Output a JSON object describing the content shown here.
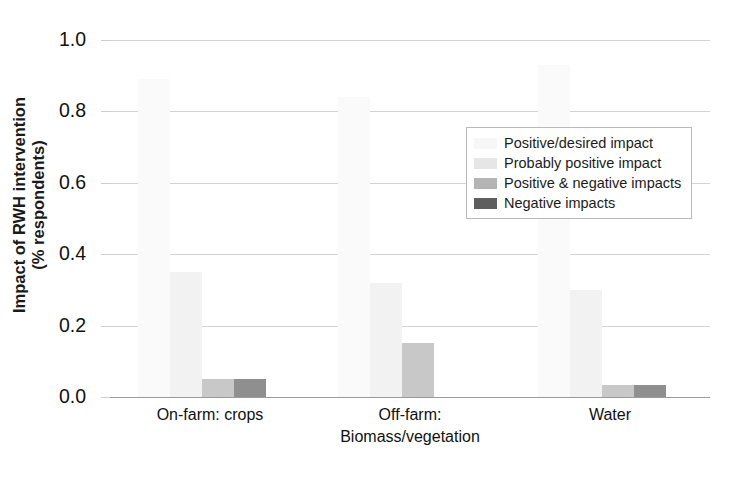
{
  "chart_data": {
    "type": "bar",
    "title": "",
    "subtitle": "",
    "xlabel": "",
    "ylabel": "Impact of RWH intervention (% respondents)",
    "ylabel_lines": [
      "Impact of RWH intervention",
      "(% respondents)"
    ],
    "ylim": [
      0.0,
      1.0
    ],
    "yticks": [
      "1.0",
      "0.8",
      "0.6",
      "0.4",
      "0.2",
      "0.0"
    ],
    "ytick_values": [
      1.0,
      0.8,
      0.6,
      0.4,
      0.2,
      0.0
    ],
    "grid": true,
    "grid_axis": "y",
    "legend_position": "upper-right",
    "categories": [
      "On-farm: crops",
      "Off-farm: Biomass/vegetation",
      "Water"
    ],
    "category_lines": [
      [
        "On-farm: crops"
      ],
      [
        "Off-farm:",
        "Biomass/vegetation"
      ],
      [
        "Water"
      ]
    ],
    "series": [
      {
        "name": "Positive/desired impact",
        "color": "#fafafa",
        "values": [
          0.89,
          0.84,
          0.93
        ]
      },
      {
        "name": "Probably positive impact",
        "color": "#f2f2f2",
        "values": [
          0.35,
          0.32,
          0.3
        ]
      },
      {
        "name": "Positive & negative impacts",
        "color": "#c8c8c8",
        "values": [
          0.05,
          0.15,
          0.035
        ]
      },
      {
        "name": "Negative impacts",
        "color": "#8f8f8f",
        "values": [
          0.05,
          0.0,
          0.035
        ]
      }
    ]
  },
  "legend": {
    "items": [
      {
        "label": "Positive/desired impact",
        "color": "#f7f7f7"
      },
      {
        "label": "Probably positive impact",
        "color": "#e6e6e6"
      },
      {
        "label": "Positive & negative impacts",
        "color": "#b4b4b4"
      },
      {
        "label": "Negative impacts",
        "color": "#5e5e5e"
      }
    ]
  },
  "colors": {
    "gridline": "#d4d4d4",
    "axis": "#9a9a9a",
    "text": "#111111",
    "legend_border": "#b9b9b9",
    "background": "#ffffff"
  }
}
